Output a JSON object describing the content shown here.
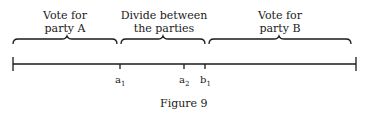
{
  "regions": [
    {
      "line1": "Vote for",
      "line2": "party A"
    },
    {
      "line1": "Divide between",
      "line2": "the parties"
    },
    {
      "line1": "Vote for",
      "line2": "party B"
    }
  ],
  "ticks": [
    {
      "base": "a",
      "sub": "1"
    },
    {
      "base": "a",
      "sub": "2"
    },
    {
      "base": "b",
      "sub": "1"
    }
  ],
  "caption": "Figure 9"
}
